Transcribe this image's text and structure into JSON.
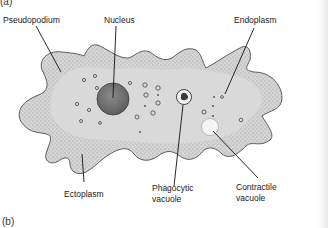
{
  "figure": {
    "panel_a_label": "(a)",
    "panel_b_label": "(b)",
    "colors": {
      "cytoplasm_fill": "#d4d4d4",
      "ectoplasm_stipple": "#6a6a6a",
      "nucleus_fill": "#7a7a7a",
      "outline": "#3a3a3a",
      "leader_line": "#111111",
      "vacuole_fill": "#f4f4f4"
    }
  },
  "labels": {
    "pseudopodium": "Pseudopodium",
    "nucleus": "Nucleus",
    "endoplasm": "Endoplasm",
    "ectoplasm": "Ectoplasm",
    "phagocytic_line1": "Phagocytic",
    "phagocytic_line2": "vacuole",
    "contractile_line1": "Contractile",
    "contractile_line2": "vacuole"
  }
}
